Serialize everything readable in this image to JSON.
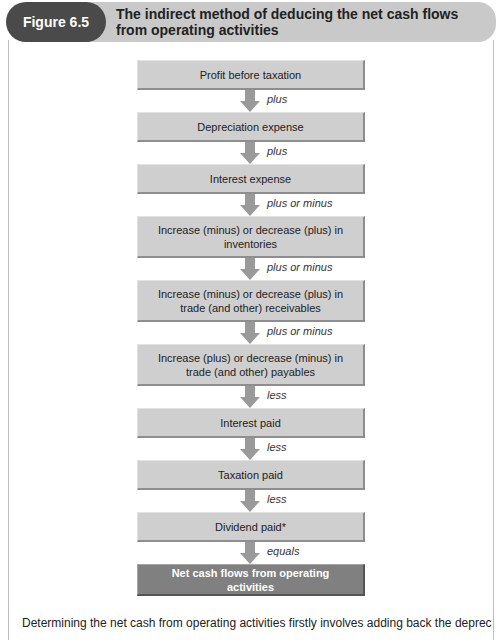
{
  "figure": {
    "label": "Figure 6.5",
    "title": "The indirect method of deducing the net cash flows from operating activities"
  },
  "steps": [
    {
      "text": "Profit before taxation",
      "op_after": "plus"
    },
    {
      "text": "Depreciation expense",
      "op_after": "plus"
    },
    {
      "text": "Interest expense",
      "op_after": "plus or minus"
    },
    {
      "text": "Increase (minus) or decrease (plus) in inventories",
      "op_after": "plus or minus"
    },
    {
      "text": "Increase (minus) or decrease (plus) in trade (and other) receivables",
      "op_after": "plus or minus"
    },
    {
      "text": "Increase (plus) or decrease (minus) in trade (and other) payables",
      "op_after": "less"
    },
    {
      "text": "Interest paid",
      "op_after": "less"
    },
    {
      "text": "Taxation paid",
      "op_after": "less"
    },
    {
      "text": "Dividend paid*",
      "op_after": "equals"
    },
    {
      "text": "Net cash flows from operating activities",
      "op_after": null
    }
  ],
  "colors": {
    "pill": "#4a4a4a",
    "band": "#c9c9c9",
    "box": "#cfcfcf",
    "final_box": "#808080",
    "arrow": "#9a9a9a"
  },
  "body_text_partial": "Determining the net cash from operating activities firstly involves adding back the depreciation"
}
